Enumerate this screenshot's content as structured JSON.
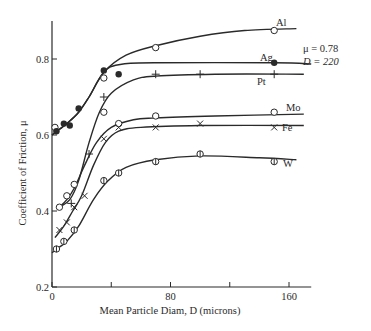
{
  "chart_data": {
    "type": "line",
    "title": "",
    "xlabel": "Mean Particle Diam, D (microns)",
    "ylabel": "Coefficient of Friction, μ",
    "xlim": [
      0,
      175
    ],
    "ylim": [
      0.2,
      0.9
    ],
    "x_ticks": [
      0,
      40,
      80,
      120,
      160
    ],
    "x_tick_labels": [
      "0",
      "",
      "80",
      "",
      "160"
    ],
    "y_ticks": [
      0.2,
      0.4,
      0.6,
      0.8
    ],
    "y_tick_labels": [
      "0.2",
      "0.4",
      "0.6",
      "0.8"
    ],
    "grid": false,
    "legend": "inline labels at right end of curves",
    "annotation": {
      "line1": "μ = 0.78",
      "line2": "D = 220"
    },
    "series": [
      {
        "name": "Al",
        "marker": "open-circle",
        "points": [
          [
            2,
            0.62
          ],
          [
            35,
            0.75
          ],
          [
            70,
            0.83
          ],
          [
            150,
            0.875
          ]
        ],
        "curve": [
          [
            0,
            0.6
          ],
          [
            5,
            0.615
          ],
          [
            10,
            0.63
          ],
          [
            18,
            0.66
          ],
          [
            25,
            0.7
          ],
          [
            35,
            0.765
          ],
          [
            50,
            0.81
          ],
          [
            70,
            0.835
          ],
          [
            100,
            0.86
          ],
          [
            130,
            0.875
          ],
          [
            165,
            0.88
          ]
        ]
      },
      {
        "name": "Ag",
        "marker": "filled-circle",
        "points": [
          [
            3,
            0.61
          ],
          [
            8,
            0.63
          ],
          [
            12,
            0.625
          ],
          [
            18,
            0.67
          ],
          [
            35,
            0.77
          ],
          [
            45,
            0.76
          ],
          [
            150,
            0.79
          ]
        ],
        "curve": [
          [
            0,
            0.6
          ],
          [
            5,
            0.615
          ],
          [
            10,
            0.63
          ],
          [
            18,
            0.66
          ],
          [
            25,
            0.7
          ],
          [
            35,
            0.765
          ],
          [
            45,
            0.785
          ],
          [
            70,
            0.79
          ],
          [
            150,
            0.79
          ],
          [
            175,
            0.787
          ]
        ]
      },
      {
        "name": "Pt",
        "marker": "plus",
        "points": [
          [
            13,
            0.42
          ],
          [
            25,
            0.55
          ],
          [
            35,
            0.7
          ],
          [
            70,
            0.76
          ],
          [
            100,
            0.76
          ],
          [
            150,
            0.76
          ]
        ],
        "curve": [
          [
            5,
            0.41
          ],
          [
            12,
            0.43
          ],
          [
            18,
            0.48
          ],
          [
            25,
            0.58
          ],
          [
            32,
            0.66
          ],
          [
            40,
            0.71
          ],
          [
            55,
            0.745
          ],
          [
            70,
            0.755
          ],
          [
            110,
            0.76
          ],
          [
            170,
            0.76
          ]
        ]
      },
      {
        "name": "Mo",
        "marker": "open-circle",
        "points": [
          [
            5,
            0.41
          ],
          [
            10,
            0.44
          ],
          [
            15,
            0.47
          ],
          [
            35,
            0.66
          ],
          [
            45,
            0.63
          ],
          [
            70,
            0.65
          ],
          [
            150,
            0.66
          ]
        ],
        "curve": [
          [
            5,
            0.41
          ],
          [
            10,
            0.43
          ],
          [
            15,
            0.46
          ],
          [
            22,
            0.52
          ],
          [
            30,
            0.58
          ],
          [
            40,
            0.62
          ],
          [
            55,
            0.64
          ],
          [
            70,
            0.645
          ],
          [
            110,
            0.65
          ],
          [
            170,
            0.655
          ]
        ]
      },
      {
        "name": "Fe",
        "marker": "cross",
        "points": [
          [
            5,
            0.35
          ],
          [
            10,
            0.37
          ],
          [
            15,
            0.41
          ],
          [
            22,
            0.44
          ],
          [
            35,
            0.59
          ],
          [
            45,
            0.62
          ],
          [
            70,
            0.62
          ],
          [
            100,
            0.63
          ],
          [
            150,
            0.62
          ]
        ],
        "curve": [
          [
            2,
            0.33
          ],
          [
            8,
            0.36
          ],
          [
            14,
            0.4
          ],
          [
            20,
            0.44
          ],
          [
            28,
            0.52
          ],
          [
            36,
            0.58
          ],
          [
            45,
            0.61
          ],
          [
            60,
            0.62
          ],
          [
            100,
            0.625
          ],
          [
            170,
            0.625
          ]
        ]
      },
      {
        "name": "W",
        "marker": "circle-bar",
        "points": [
          [
            3,
            0.3
          ],
          [
            8,
            0.32
          ],
          [
            15,
            0.35
          ],
          [
            35,
            0.48
          ],
          [
            45,
            0.5
          ],
          [
            70,
            0.53
          ],
          [
            100,
            0.55
          ],
          [
            150,
            0.53
          ]
        ],
        "curve": [
          [
            0,
            0.29
          ],
          [
            5,
            0.305
          ],
          [
            10,
            0.32
          ],
          [
            18,
            0.36
          ],
          [
            28,
            0.43
          ],
          [
            38,
            0.48
          ],
          [
            50,
            0.515
          ],
          [
            70,
            0.535
          ],
          [
            100,
            0.545
          ],
          [
            140,
            0.54
          ],
          [
            165,
            0.535
          ]
        ]
      }
    ]
  }
}
